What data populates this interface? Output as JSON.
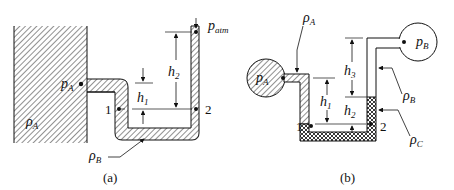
{
  "figures": [
    {
      "id": "a",
      "caption": "(a)",
      "labels": {
        "tank_fluid": "ρ",
        "tank_fluid_sub": "A",
        "tap_pressure": "p",
        "tap_pressure_sub": "A",
        "atm_pressure": "p",
        "atm_pressure_sub": "atm",
        "manometer_fluid": "ρ",
        "manometer_fluid_sub": "B",
        "h1": "h",
        "h1_sub": "1",
        "h2": "h",
        "h2_sub": "2",
        "point1": "1",
        "point2": "2"
      }
    },
    {
      "id": "b",
      "caption": "(b)",
      "labels": {
        "bulb_a": "p",
        "bulb_a_sub": "A",
        "bulb_b": "p",
        "bulb_b_sub": "B",
        "fluid_a": "ρ",
        "fluid_a_sub": "A",
        "fluid_b": "ρ",
        "fluid_b_sub": "B",
        "fluid_c": "ρ",
        "fluid_c_sub": "C",
        "h1": "h",
        "h1_sub": "1",
        "h2": "h",
        "h2_sub": "2",
        "h3": "h",
        "h3_sub": "3",
        "point1": "1",
        "point2": "2"
      }
    }
  ]
}
